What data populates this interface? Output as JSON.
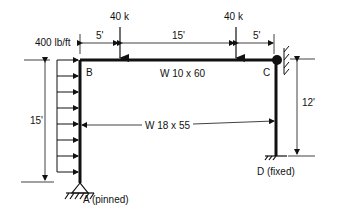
{
  "diagram": {
    "loads": {
      "point_load_1": "40 k",
      "point_load_2": "40 k",
      "distributed_load": "400 lb/ft"
    },
    "dimensions": {
      "span_left": "5'",
      "span_middle": "15'",
      "span_right": "5'",
      "left_column_height": "15'",
      "right_column_height": "12'"
    },
    "members": {
      "beam": "W 10 x 60",
      "columns": "W 18 x 55"
    },
    "nodes": {
      "B": "B",
      "C": "C",
      "A": "A (pinned)",
      "D": "D (fixed)"
    },
    "colors": {
      "line": "#111111",
      "background": "#ffffff"
    }
  }
}
